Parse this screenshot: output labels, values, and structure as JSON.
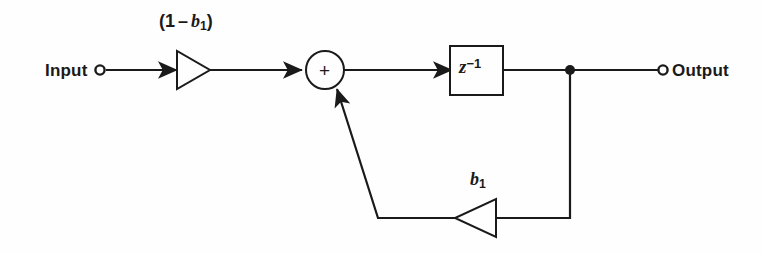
{
  "figure": {
    "type": "signal-flow-block-diagram",
    "background_color": "#fefefe",
    "line_color": "#1a1a1a"
  },
  "terminals": {
    "input_label": "Input",
    "output_label": "Output"
  },
  "blocks": {
    "forward_gain": {
      "name": "forward-gain-triangle",
      "label_text": "(1 – b1)",
      "label_parts": {
        "open": "(",
        "one": "1",
        "minus": "–",
        "var": "b",
        "sub": "1",
        "close": ")"
      },
      "direction": "left-to-right"
    },
    "delay": {
      "name": "unit-delay-block",
      "label_text": "z-1",
      "label_parts": {
        "var": "z",
        "sup": "−1"
      }
    },
    "feedback_gain": {
      "name": "feedback-gain-triangle",
      "label_text": "b1",
      "label_parts": {
        "var": "b",
        "sub": "1"
      },
      "direction": "right-to-left"
    },
    "summer": {
      "name": "summing-junction",
      "sign": "+"
    },
    "tap": {
      "name": "output-tap-node"
    }
  },
  "signal_paths": [
    {
      "name": "input-to-forward-gain"
    },
    {
      "name": "forward-gain-to-summer"
    },
    {
      "name": "summer-to-delay"
    },
    {
      "name": "delay-to-output-tap"
    },
    {
      "name": "output-tap-to-output-terminal"
    },
    {
      "name": "output-tap-down-to-feedback"
    },
    {
      "name": "feedback-gain-to-summer"
    }
  ]
}
